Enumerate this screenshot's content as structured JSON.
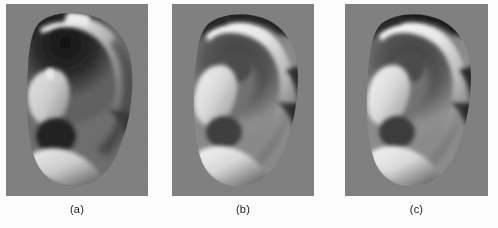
{
  "figure": {
    "page_background": "#fdfdfd",
    "panel_background_gray": "#808080",
    "caption_color": "#1a1a1a",
    "panels": [
      {
        "id": "a",
        "caption": "(a)",
        "description": "Grayscale ear image with dark, low-illumination upper concha region",
        "x": 6,
        "y": 4,
        "width": 142,
        "height": 192,
        "tone": {
          "background": "#808080",
          "highlight": "#f2f2f2",
          "midtone": "#9a9a9a",
          "shadow": "#262626",
          "deep_shadow": "#0f0f0f"
        },
        "illumination": "upper-concha dark"
      },
      {
        "id": "b",
        "caption": "(b)",
        "description": "Grayscale ear image with bright helix rim and shadowed concha",
        "x": 172,
        "y": 4,
        "width": 142,
        "height": 192,
        "tone": {
          "background": "#808080",
          "highlight": "#f7f7f7",
          "midtone": "#a8a8a8",
          "shadow": "#303030",
          "deep_shadow": "#121212"
        },
        "illumination": "frontal, bright helix"
      },
      {
        "id": "c",
        "caption": "(c)",
        "description": "Grayscale ear image near-identical to panel b, bright helix rim",
        "x": 345,
        "y": 4,
        "width": 143,
        "height": 192,
        "tone": {
          "background": "#808080",
          "highlight": "#f8f8f8",
          "midtone": "#aaaaaa",
          "shadow": "#2e2e2e",
          "deep_shadow": "#101010"
        },
        "illumination": "frontal, bright helix"
      }
    ]
  }
}
